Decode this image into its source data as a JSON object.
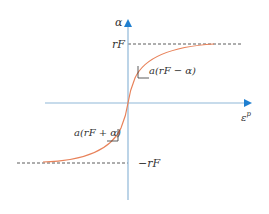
{
  "diagram": {
    "type": "saturation-curve",
    "axes": {
      "y_label": "α",
      "x_label": "ε",
      "x_label_superscript": "p"
    },
    "levels": {
      "upper_label": "rF",
      "lower_label": "−rF"
    },
    "annotations": {
      "upper_slope": "a(rF − α)",
      "lower_slope": "a(rF + α)"
    },
    "colors": {
      "axis": "#8fb8d8",
      "arrow": "#1f7fd0",
      "curve": "#e8825a",
      "dashed": "#333333",
      "text": "#333333"
    }
  }
}
